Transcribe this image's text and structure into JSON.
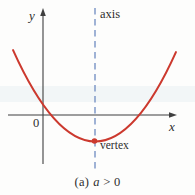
{
  "figure": {
    "labels": {
      "y_axis": "y",
      "x_axis": "x",
      "origin": "0",
      "axis_of_symmetry": "axis",
      "vertex": "vertex"
    },
    "caption": {
      "index": "(a)",
      "variable": "a",
      "condition": "> 0"
    },
    "colors": {
      "curve": "#cc392e",
      "axis_line": "#3f3f3f",
      "symmetry_line": "#8099c8",
      "text": "#2e2e2e",
      "background": "#fdfdfc"
    }
  }
}
